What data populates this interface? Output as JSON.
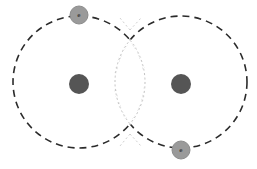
{
  "canvas": {
    "width": 257,
    "height": 169,
    "background_color": "#ffffff"
  },
  "colors": {
    "orbital_stroke": "#2b2b2b",
    "overlap_stroke": "#b9b9b9",
    "nucleus_fill": "#555555",
    "electron_fill": "#9a9a9a",
    "electron_stroke": "#8c8c8c",
    "electron_label_color": "#3a3a3a"
  },
  "diagram": {
    "orbitals": [
      {
        "name": "left-orbital",
        "cx": 79,
        "cy": 82,
        "r": 66,
        "stroke": "#2b2b2b",
        "stroke_width": 1.6,
        "dash": "7 5",
        "fill": "none"
      },
      {
        "name": "right-orbital",
        "cx": 181,
        "cy": 82,
        "r": 66,
        "stroke": "#2b2b2b",
        "stroke_width": 1.6,
        "dash": "7 5",
        "fill": "none"
      }
    ],
    "overlap_region": {
      "name": "overlap-lens",
      "label": "bonding overlap region",
      "stroke": "#b9b9b9",
      "stroke_width": 0.9,
      "dash": "2 2.5",
      "fill": "none",
      "intersection_top_y": 30,
      "intersection_bottom_y": 134,
      "intersection_x": 130,
      "left_extent_x": 115,
      "right_extent_x": 145
    },
    "nuclei": [
      {
        "name": "left-nucleus",
        "cx": 79,
        "cy": 84,
        "r": 10,
        "fill": "#555555"
      },
      {
        "name": "right-nucleus",
        "cx": 181,
        "cy": 84,
        "r": 10,
        "fill": "#555555"
      }
    ],
    "electrons": [
      {
        "name": "electron-top-left",
        "cx": 79,
        "cy": 15,
        "r": 9,
        "fill": "#9a9a9a",
        "stroke": "#8c8c8c",
        "label": "e"
      },
      {
        "name": "electron-bottom-right",
        "cx": 181,
        "cy": 150,
        "r": 9,
        "fill": "#9a9a9a",
        "stroke": "#8c8c8c",
        "label": "e"
      }
    ]
  }
}
